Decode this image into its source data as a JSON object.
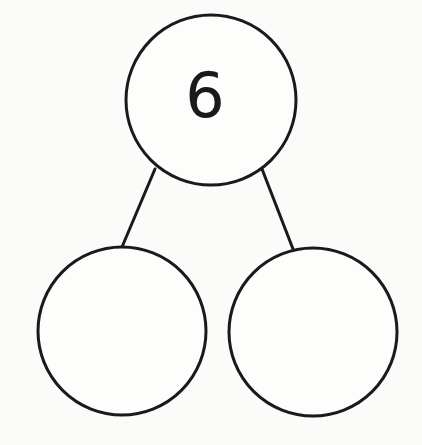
{
  "diagram": {
    "type": "number-bond",
    "stroke_color": "#1a1a1a",
    "background": "#fbfbfa",
    "whole": {
      "label": "6",
      "cx": 211,
      "cy": 100,
      "r": 85
    },
    "parts": [
      {
        "label": "",
        "cx": 122,
        "cy": 331,
        "r": 84
      },
      {
        "label": "",
        "cx": 313,
        "cy": 332,
        "r": 84
      }
    ],
    "connectors": [
      {
        "x1": 155,
        "y1": 169,
        "x2": 122,
        "y2": 247
      },
      {
        "x1": 262,
        "y1": 169,
        "x2": 293,
        "y2": 249
      }
    ]
  }
}
